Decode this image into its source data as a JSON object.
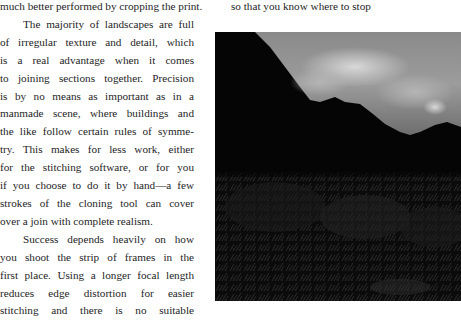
{
  "left_column": {
    "lines": [
      "much better performed by cropping the print.",
      "The majority of landscapes are full",
      "of irregular texture and detail, which",
      "is a real advantage when it comes",
      "to joining sections together. Precision",
      "is by no means as important as in a",
      "manmade scene, where buildings and",
      "the like follow certain rules of symme-",
      "try. This makes for less work, either",
      "for the stitching software, or for you",
      "if you choose to do it by hand—a few",
      "strokes of the cloning tool can cover",
      "over a join with complete realism.",
      "Success depends heavily on how",
      "you shoot the strip of frames in the",
      "first place. Using a longer focal length",
      "reduces edge distortion for easier",
      "stitching and there is no suitable"
    ]
  },
  "right_column": {
    "lines": [
      "so that you know where to stop"
    ]
  }
}
